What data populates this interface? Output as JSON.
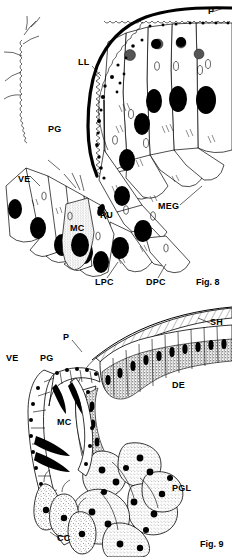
{
  "plate": {
    "title": "Histological plate: Figures 8 and 9",
    "background": "#ffffff",
    "ink": "#000000",
    "width": 232,
    "height": 557
  },
  "figures": [
    {
      "id": "fig8",
      "caption": "Fig. 8",
      "caption_x": 196,
      "caption_y": 285,
      "description": "Sagittal section of integument showing pupal cuticle, epidermal glandular cells and moulting gel",
      "labels": [
        {
          "key": "P",
          "text": "P",
          "x": 208,
          "y": 14,
          "anchor": "start"
        },
        {
          "key": "LL",
          "text": "LL",
          "x": 78,
          "y": 65,
          "anchor": "start"
        },
        {
          "key": "PG",
          "text": "PG",
          "x": 48,
          "y": 132,
          "anchor": "start"
        },
        {
          "key": "VE",
          "text": "VE",
          "x": 18,
          "y": 182,
          "anchor": "start"
        },
        {
          "key": "MEG",
          "text": "MEG",
          "x": 158,
          "y": 209,
          "anchor": "start"
        },
        {
          "key": "PU",
          "text": "PU",
          "x": 100,
          "y": 218,
          "anchor": "start"
        },
        {
          "key": "MC",
          "text": "MC",
          "x": 70,
          "y": 231,
          "anchor": "start"
        },
        {
          "key": "LPC",
          "text": "LPC",
          "x": 95,
          "y": 285,
          "anchor": "start"
        },
        {
          "key": "DPC",
          "text": "DPC",
          "x": 146,
          "y": 285,
          "anchor": "start"
        }
      ]
    },
    {
      "id": "fig9",
      "caption": "Fig. 9",
      "caption_x": 200,
      "caption_y": 547,
      "description": "Section of integument with shell, dermal epithelium, pupal cuticle and pigment gland lobes",
      "labels": [
        {
          "key": "SH",
          "text": "SH",
          "x": 210,
          "y": 325,
          "anchor": "start"
        },
        {
          "key": "P",
          "text": "P",
          "x": 63,
          "y": 340,
          "anchor": "start"
        },
        {
          "key": "VE",
          "text": "VE",
          "x": 6,
          "y": 361,
          "anchor": "start"
        },
        {
          "key": "PG",
          "text": "PG",
          "x": 40,
          "y": 361,
          "anchor": "start"
        },
        {
          "key": "DE",
          "text": "DE",
          "x": 172,
          "y": 388,
          "anchor": "start"
        },
        {
          "key": "MC",
          "text": "MC",
          "x": 57,
          "y": 425,
          "anchor": "start"
        },
        {
          "key": "PGL",
          "text": "PGL",
          "x": 172,
          "y": 491,
          "anchor": "start"
        },
        {
          "key": "CC",
          "text": "CC",
          "x": 57,
          "y": 541,
          "anchor": "start"
        }
      ]
    }
  ],
  "legend_keys": {
    "P": "pupal cuticle",
    "LL": "lamellate layer",
    "PG": "pupal gel / moulting space",
    "VE": "ventral epidermis",
    "MEG": "moulting gel",
    "PU": "pore canal unit",
    "MC": "mucous cell",
    "LPC": "lateral pigment cell",
    "DPC": "dorsal pigment cell",
    "SH": "shell",
    "DE": "dermal epithelium",
    "PGL": "pigment gland lobe",
    "CC": "columnar cell"
  }
}
